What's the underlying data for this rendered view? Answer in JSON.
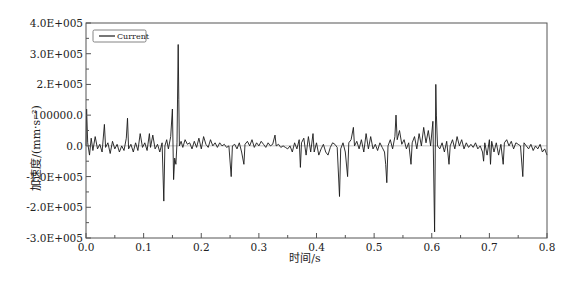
{
  "chart_data": {
    "type": "line",
    "title": "",
    "xlabel": "时间/s",
    "ylabel": "加速度/(mm·s⁻²)",
    "xlim": [
      0.0,
      0.8
    ],
    "ylim": [
      -300000,
      400000
    ],
    "grid": false,
    "legend_position": "upper-left",
    "x_ticks": [
      "0.0",
      "0.1",
      "0.2",
      "0.3",
      "0.4",
      "0.5",
      "0.6",
      "0.7",
      "0.8"
    ],
    "y_ticks": [
      "4.0E+005",
      "3.0E+005",
      "2.E+005",
      "100000.0",
      "0.0",
      "-1.0E+005",
      "-2.0E+005",
      "-3.0E+005"
    ],
    "series": [
      {
        "name": "Current",
        "color": "#1a1a1a",
        "points": [
          [
            0.0,
            0
          ],
          [
            0.001,
            120000
          ],
          [
            0.003,
            10000
          ],
          [
            0.006,
            -30000
          ],
          [
            0.009,
            25000
          ],
          [
            0.012,
            -15000
          ],
          [
            0.016,
            30000
          ],
          [
            0.02,
            -10000
          ],
          [
            0.024,
            5000
          ],
          [
            0.028,
            -20000
          ],
          [
            0.032,
            70000
          ],
          [
            0.034,
            -5000
          ],
          [
            0.038,
            10000
          ],
          [
            0.042,
            -25000
          ],
          [
            0.046,
            15000
          ],
          [
            0.05,
            -10000
          ],
          [
            0.054,
            5000
          ],
          [
            0.058,
            -20000
          ],
          [
            0.062,
            0
          ],
          [
            0.066,
            -15000
          ],
          [
            0.07,
            25000
          ],
          [
            0.072,
            90000
          ],
          [
            0.074,
            -10000
          ],
          [
            0.078,
            5000
          ],
          [
            0.082,
            -20000
          ],
          [
            0.086,
            10000
          ],
          [
            0.09,
            -15000
          ],
          [
            0.094,
            40000
          ],
          [
            0.098,
            -5000
          ],
          [
            0.102,
            10000
          ],
          [
            0.106,
            -15000
          ],
          [
            0.11,
            40000
          ],
          [
            0.112,
            -5000
          ],
          [
            0.116,
            35000
          ],
          [
            0.12,
            -10000
          ],
          [
            0.124,
            5000
          ],
          [
            0.128,
            -20000
          ],
          [
            0.132,
            10000
          ],
          [
            0.135,
            -180000
          ],
          [
            0.137,
            0
          ],
          [
            0.14,
            20000
          ],
          [
            0.143,
            -10000
          ],
          [
            0.147,
            30000
          ],
          [
            0.15,
            120000
          ],
          [
            0.152,
            -110000
          ],
          [
            0.154,
            -40000
          ],
          [
            0.156,
            -60000
          ],
          [
            0.158,
            10000
          ],
          [
            0.16,
            330000
          ],
          [
            0.161,
            150000
          ],
          [
            0.162,
            0
          ],
          [
            0.165,
            15000
          ],
          [
            0.168,
            -5000
          ],
          [
            0.172,
            20000
          ],
          [
            0.176,
            5000
          ],
          [
            0.18,
            10000
          ],
          [
            0.184,
            -10000
          ],
          [
            0.188,
            15000
          ],
          [
            0.192,
            -5000
          ],
          [
            0.196,
            25000
          ],
          [
            0.2,
            -10000
          ],
          [
            0.204,
            30000
          ],
          [
            0.208,
            5000
          ],
          [
            0.212,
            -5000
          ],
          [
            0.216,
            20000
          ],
          [
            0.22,
            0
          ],
          [
            0.224,
            10000
          ],
          [
            0.228,
            -5000
          ],
          [
            0.232,
            10000
          ],
          [
            0.236,
            0
          ],
          [
            0.24,
            5000
          ],
          [
            0.244,
            -5000
          ],
          [
            0.248,
            0
          ],
          [
            0.252,
            -100000
          ],
          [
            0.254,
            0
          ],
          [
            0.258,
            5000
          ],
          [
            0.262,
            -10000
          ],
          [
            0.266,
            10000
          ],
          [
            0.27,
            -20000
          ],
          [
            0.274,
            -60000
          ],
          [
            0.276,
            5000
          ],
          [
            0.28,
            15000
          ],
          [
            0.284,
            0
          ],
          [
            0.288,
            20000
          ],
          [
            0.292,
            -5000
          ],
          [
            0.296,
            10000
          ],
          [
            0.3,
            0
          ],
          [
            0.304,
            15000
          ],
          [
            0.308,
            5000
          ],
          [
            0.312,
            -5000
          ],
          [
            0.316,
            10000
          ],
          [
            0.32,
            0
          ],
          [
            0.324,
            5000
          ],
          [
            0.328,
            35000
          ],
          [
            0.33,
            0
          ],
          [
            0.334,
            5000
          ],
          [
            0.338,
            -5000
          ],
          [
            0.342,
            0
          ],
          [
            0.346,
            -5000
          ],
          [
            0.35,
            -10000
          ],
          [
            0.354,
            0
          ],
          [
            0.358,
            -20000
          ],
          [
            0.362,
            10000
          ],
          [
            0.366,
            -10000
          ],
          [
            0.37,
            20000
          ],
          [
            0.372,
            -70000
          ],
          [
            0.374,
            10000
          ],
          [
            0.378,
            25000
          ],
          [
            0.382,
            -30000
          ],
          [
            0.386,
            30000
          ],
          [
            0.39,
            -20000
          ],
          [
            0.394,
            40000
          ],
          [
            0.396,
            -20000
          ],
          [
            0.4,
            10000
          ],
          [
            0.404,
            -30000
          ],
          [
            0.408,
            -10000
          ],
          [
            0.412,
            5000
          ],
          [
            0.416,
            -20000
          ],
          [
            0.42,
            -30000
          ],
          [
            0.424,
            -5000
          ],
          [
            0.428,
            10000
          ],
          [
            0.432,
            5000
          ],
          [
            0.436,
            -5000
          ],
          [
            0.44,
            -165000
          ],
          [
            0.442,
            -10000
          ],
          [
            0.446,
            10000
          ],
          [
            0.45,
            -20000
          ],
          [
            0.454,
            -100000
          ],
          [
            0.456,
            10000
          ],
          [
            0.46,
            20000
          ],
          [
            0.464,
            60000
          ],
          [
            0.466,
            0
          ],
          [
            0.47,
            15000
          ],
          [
            0.474,
            -10000
          ],
          [
            0.478,
            20000
          ],
          [
            0.482,
            -20000
          ],
          [
            0.486,
            40000
          ],
          [
            0.49,
            -10000
          ],
          [
            0.494,
            30000
          ],
          [
            0.498,
            -10000
          ],
          [
            0.502,
            5000
          ],
          [
            0.506,
            -15000
          ],
          [
            0.51,
            10000
          ],
          [
            0.514,
            -5000
          ],
          [
            0.518,
            -20000
          ],
          [
            0.52,
            -60000
          ],
          [
            0.522,
            -120000
          ],
          [
            0.524,
            0
          ],
          [
            0.528,
            20000
          ],
          [
            0.532,
            -10000
          ],
          [
            0.536,
            30000
          ],
          [
            0.538,
            100000
          ],
          [
            0.54,
            20000
          ],
          [
            0.544,
            50000
          ],
          [
            0.548,
            5000
          ],
          [
            0.552,
            20000
          ],
          [
            0.556,
            -10000
          ],
          [
            0.56,
            10000
          ],
          [
            0.564,
            -60000
          ],
          [
            0.566,
            10000
          ],
          [
            0.57,
            30000
          ],
          [
            0.574,
            -10000
          ],
          [
            0.578,
            40000
          ],
          [
            0.582,
            0
          ],
          [
            0.586,
            60000
          ],
          [
            0.59,
            10000
          ],
          [
            0.594,
            50000
          ],
          [
            0.598,
            0
          ],
          [
            0.602,
            80000
          ],
          [
            0.605,
            -280000
          ],
          [
            0.607,
            200000
          ],
          [
            0.608,
            100000
          ],
          [
            0.61,
            0
          ],
          [
            0.614,
            -10000
          ],
          [
            0.618,
            10000
          ],
          [
            0.622,
            -20000
          ],
          [
            0.626,
            15000
          ],
          [
            0.63,
            -60000
          ],
          [
            0.632,
            0
          ],
          [
            0.636,
            20000
          ],
          [
            0.64,
            -10000
          ],
          [
            0.644,
            30000
          ],
          [
            0.648,
            0
          ],
          [
            0.652,
            20000
          ],
          [
            0.656,
            -10000
          ],
          [
            0.66,
            10000
          ],
          [
            0.664,
            -5000
          ],
          [
            0.668,
            5000
          ],
          [
            0.672,
            -5000
          ],
          [
            0.676,
            10000
          ],
          [
            0.68,
            -10000
          ],
          [
            0.684,
            0
          ],
          [
            0.688,
            -20000
          ],
          [
            0.69,
            -50000
          ],
          [
            0.692,
            10000
          ],
          [
            0.696,
            -30000
          ],
          [
            0.7,
            20000
          ],
          [
            0.702,
            -60000
          ],
          [
            0.704,
            15000
          ],
          [
            0.708,
            -20000
          ],
          [
            0.712,
            10000
          ],
          [
            0.716,
            -30000
          ],
          [
            0.72,
            5000
          ],
          [
            0.724,
            -60000
          ],
          [
            0.726,
            10000
          ],
          [
            0.73,
            20000
          ],
          [
            0.734,
            0
          ],
          [
            0.738,
            15000
          ],
          [
            0.742,
            -10000
          ],
          [
            0.746,
            10000
          ],
          [
            0.75,
            5000
          ],
          [
            0.754,
            0
          ],
          [
            0.758,
            -100000
          ],
          [
            0.76,
            10000
          ],
          [
            0.764,
            0
          ],
          [
            0.768,
            -10000
          ],
          [
            0.772,
            5000
          ],
          [
            0.776,
            -15000
          ],
          [
            0.78,
            0
          ],
          [
            0.784,
            -10000
          ],
          [
            0.788,
            5000
          ],
          [
            0.792,
            -20000
          ],
          [
            0.796,
            -10000
          ],
          [
            0.8,
            -30000
          ]
        ]
      }
    ]
  },
  "legend": {
    "label": "Current"
  },
  "axes": {
    "xlabel": "时间/s",
    "ylabel": "加速度/(mm·s⁻²)"
  }
}
